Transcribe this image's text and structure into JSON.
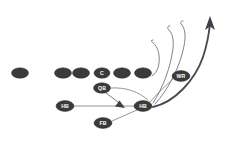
{
  "diagram": {
    "background_color": "#ffffff",
    "player_fill_color": "#3a3a3a",
    "player_label_color": "#ffffff",
    "route_color": "#6b6b72",
    "primary_route_color": "#4a4a52",
    "width": 233,
    "height": 146
  },
  "players": [
    {
      "id": "split-end",
      "label": "",
      "x": 20,
      "y": 73,
      "rx": 8.5,
      "ry": 5.2
    },
    {
      "id": "left-tackle",
      "label": "",
      "x": 63,
      "y": 73,
      "rx": 8.5,
      "ry": 5.2
    },
    {
      "id": "left-guard",
      "label": "",
      "x": 81,
      "y": 73,
      "rx": 8.5,
      "ry": 5.2
    },
    {
      "id": "center",
      "label": "C",
      "x": 102,
      "y": 73,
      "rx": 8.0,
      "ry": 5.2
    },
    {
      "id": "right-guard",
      "label": "",
      "x": 122,
      "y": 73,
      "rx": 8.5,
      "ry": 5.2
    },
    {
      "id": "right-tackle",
      "label": "",
      "x": 143,
      "y": 73,
      "rx": 8.5,
      "ry": 5.2
    },
    {
      "id": "wide-receiver",
      "label": "WR",
      "x": 181,
      "y": 76,
      "rx": 9.0,
      "ry": 5.4
    },
    {
      "id": "quarterback",
      "label": "QB",
      "x": 102,
      "y": 88,
      "rx": 8.5,
      "ry": 5.2
    },
    {
      "id": "halfback-left",
      "label": "HB",
      "x": 65,
      "y": 106,
      "rx": 9.0,
      "ry": 5.4
    },
    {
      "id": "halfback-mid",
      "label": "HB",
      "x": 143,
      "y": 106,
      "rx": 9.0,
      "ry": 5.4
    },
    {
      "id": "fullback",
      "label": "FB",
      "x": 103,
      "y": 123,
      "rx": 9.0,
      "ry": 5.4
    }
  ],
  "routes": [
    {
      "id": "route-curl-inner",
      "style": "thin",
      "path": "M 152 76 C 158 72 160 64 159 55 C 158 48 155 44 152 42 C 151 41 151 40 153 40"
    },
    {
      "id": "route-curl-middle",
      "style": "thin",
      "path": "M 153 103 C 163 88 171 66 173 48 C 174 39 172 33 169 30 C 167 28 167 26 170 26"
    },
    {
      "id": "route-curl-outer",
      "style": "thin",
      "path": "M 155 104 C 168 90 180 67 184 46 C 186 36 185 29 182 25 C 180 23 180 21 183 21"
    },
    {
      "id": "route-primary-deep",
      "style": "thick",
      "path": "M 153 107 C 175 102 195 80 203 57 C 207 45 209 33 210 24"
    }
  ],
  "primary_arrowhead": {
    "id": "deep-route-arrowhead",
    "points": "210,18 214,29 210,26 206,30"
  },
  "motion_lines": [
    {
      "id": "wr-to-hb-motion",
      "path": "M 173 79 C 163 88 155 96 150 102"
    },
    {
      "id": "qb-pull-line",
      "path": "M 111 88 C 126 87 139 92 148 100"
    },
    {
      "id": "hb-left-cross",
      "path": "M 74 106 L 136 106"
    },
    {
      "id": "fb-cross",
      "path": "M 112 121 L 137 110"
    }
  ],
  "handoff": {
    "id": "qb-handoff-arrow",
    "path": "M 106 93 L 121 104",
    "arrowhead_points": "124,107 116,105 120,101"
  }
}
